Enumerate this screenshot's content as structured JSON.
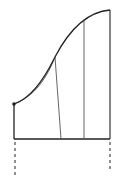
{
  "diagram": {
    "type": "geometric-area-under-curve",
    "stroke_color": "#222222",
    "thin_stroke_color": "#555555",
    "background": "#ffffff",
    "point": {
      "x": 14,
      "y": 104,
      "radius": 1.8
    },
    "baseline": {
      "x1": 14,
      "y1": 139,
      "x2": 110,
      "y2": 139
    },
    "left_edge": {
      "x1": 14,
      "y1": 104,
      "x2": 14,
      "y2": 139
    },
    "right_edge": {
      "x1": 110,
      "y1": 10,
      "x2": 110,
      "y2": 139
    },
    "main_curve": "M14,104 C26,100 40,88 55,57 C68,32 85,12 110,10",
    "secant_curve": "M14,104 C30,98 44,85 55,57",
    "slant_line": {
      "x1": 55,
      "y1": 57,
      "x2": 61,
      "y2": 139
    },
    "inner_vertical": {
      "x1": 84,
      "y1": 19,
      "x2": 84,
      "y2": 139
    },
    "left_dashed": {
      "x1": 15,
      "y1": 142,
      "x2": 15,
      "y2": 176
    },
    "right_dashed": {
      "x1": 110,
      "y1": 142,
      "x2": 110,
      "y2": 170
    }
  }
}
